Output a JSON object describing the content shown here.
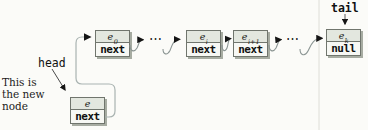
{
  "colors": {
    "pageBg": "#fbfbf8",
    "boxBorder": "#70756d",
    "boxShadow": "#a7aca2",
    "cellTopBg": "#e3e7df",
    "cellBottomBg": "#f7f8f4",
    "pointerLine": "#8a9492",
    "newNextLine": "#a9b3b1",
    "arrowHead": "#151515"
  },
  "labels": {
    "tail": "tail",
    "head": "head",
    "note": "This is\nthe new\nnode",
    "dots": "⋯"
  },
  "nodes": [
    {
      "base": "e",
      "sub": "0",
      "field": "next"
    },
    {
      "base": "e",
      "sub": "i",
      "field": "next"
    },
    {
      "base": "e",
      "sub": "i+1",
      "field": "next"
    },
    {
      "base": "e",
      "sub": "k",
      "field": "null"
    },
    {
      "base": "e",
      "sub": "",
      "field": "next"
    }
  ]
}
